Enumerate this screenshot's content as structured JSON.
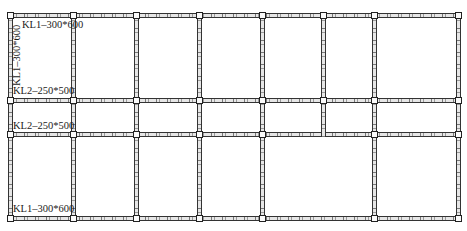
{
  "drawing": {
    "type": "structural beam layout plan",
    "grid": {
      "column_x": [
        10,
        73,
        136,
        199,
        262,
        323,
        374,
        458
      ],
      "beam_y": [
        15,
        100,
        134,
        218
      ]
    },
    "labels": {
      "top_beam": "KL1–300*600",
      "left_beam_vertical": "KL1–300*600",
      "upper_middle_beam": "KL2–250*500",
      "lower_middle_beam": "KL2–250*500",
      "bottom_beam": "KL1–300*600"
    },
    "beam_types": [
      {
        "name": "KL1",
        "section": "300*600"
      },
      {
        "name": "KL2",
        "section": "250*500"
      }
    ],
    "colors": {
      "line": "#333333",
      "fill": "#e6e6e6",
      "background": "#ffffff"
    }
  }
}
